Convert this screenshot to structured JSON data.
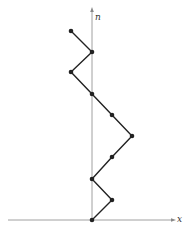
{
  "diagram": {
    "type": "lattice-path",
    "axes": {
      "x_label": "x",
      "y_label": "n",
      "axis_color": "#888888",
      "x_axis": {
        "x1": 8,
        "x2": 173,
        "y": 220
      },
      "y_axis": {
        "x": 92,
        "y1": 220,
        "y2": 10
      }
    },
    "path": {
      "color": "#222222",
      "points": [
        [
          92,
          220
        ],
        [
          112,
          200
        ],
        [
          92,
          179
        ],
        [
          112,
          157
        ],
        [
          132,
          136
        ],
        [
          112,
          115
        ],
        [
          92,
          94
        ],
        [
          71,
          72
        ],
        [
          92,
          52
        ],
        [
          71,
          31
        ]
      ]
    }
  }
}
